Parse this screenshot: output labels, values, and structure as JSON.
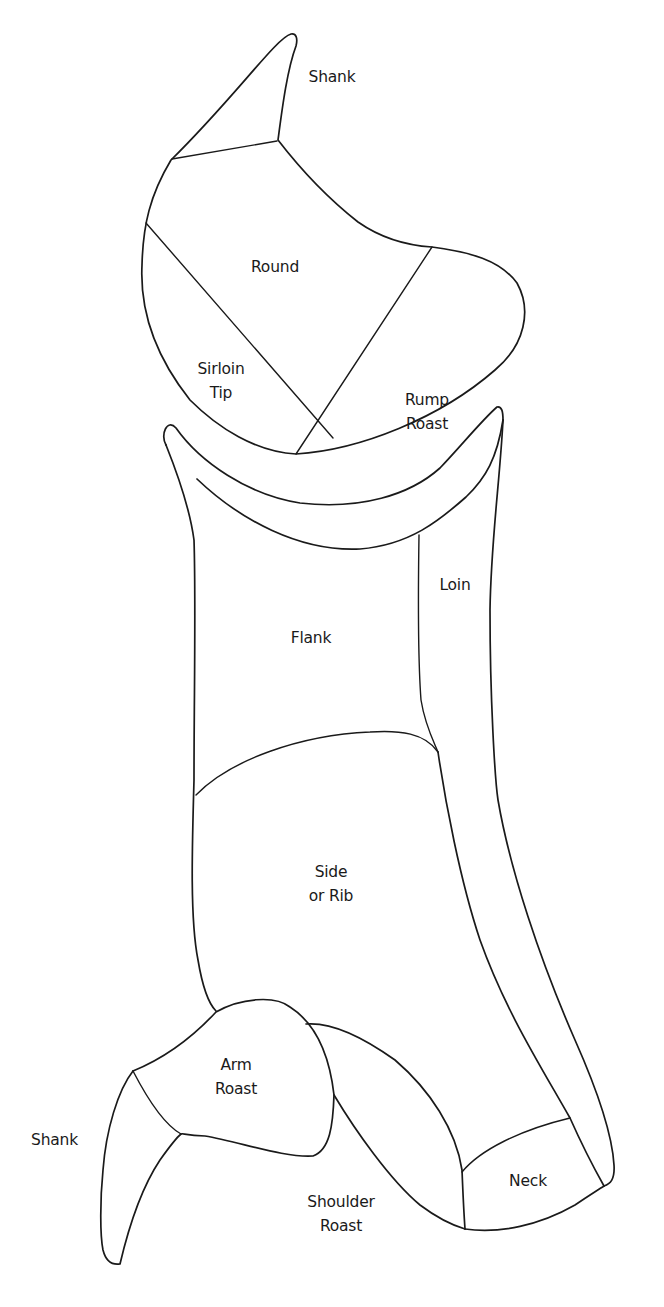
{
  "diagram": {
    "type": "meat-cuts-chart",
    "line_color": "#1a1a1a",
    "background": "#ffffff",
    "cuts": [
      {
        "id": "shank-hind",
        "label": "Shank",
        "x": 332,
        "y": 77,
        "align": "center"
      },
      {
        "id": "round",
        "label": "Round",
        "x": 275,
        "y": 267,
        "align": "center"
      },
      {
        "id": "sirloin-tip",
        "label": "Sirloin\nTip",
        "x": 221,
        "y": 381,
        "align": "center"
      },
      {
        "id": "rump-roast",
        "label": "Rump\nRoast",
        "x": 427,
        "y": 412,
        "align": "center"
      },
      {
        "id": "loin",
        "label": "Loin",
        "x": 455,
        "y": 585,
        "align": "center"
      },
      {
        "id": "flank",
        "label": "Flank",
        "x": 311,
        "y": 638,
        "align": "center"
      },
      {
        "id": "side-or-rib",
        "label": "Side\nor Rib",
        "x": 331,
        "y": 884,
        "align": "center"
      },
      {
        "id": "arm-roast",
        "label": "Arm\nRoast",
        "x": 236,
        "y": 1077,
        "align": "center"
      },
      {
        "id": "shank-fore",
        "label": "Shank",
        "x": 31,
        "y": 1140,
        "align": "left"
      },
      {
        "id": "shoulder-roast",
        "label": "Shoulder\nRoast",
        "x": 341,
        "y": 1214,
        "align": "center"
      },
      {
        "id": "neck",
        "label": "Neck",
        "x": 528,
        "y": 1181,
        "align": "center"
      }
    ]
  }
}
